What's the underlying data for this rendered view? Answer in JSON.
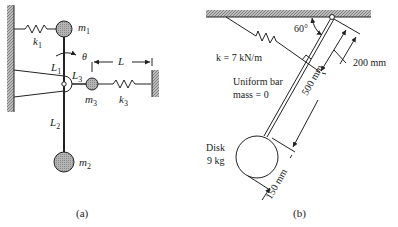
{
  "figure_a": {
    "caption": "(a)",
    "masses": [
      {
        "id": "m1",
        "label": "m",
        "sub": "1"
      },
      {
        "id": "m2",
        "label": "m",
        "sub": "2"
      },
      {
        "id": "m3",
        "label": "m",
        "sub": "3"
      }
    ],
    "springs": [
      {
        "id": "k1",
        "label": "k",
        "sub": "1"
      },
      {
        "id": "k3",
        "label": "k",
        "sub": "3"
      }
    ],
    "lengths": [
      {
        "id": "L1",
        "label": "L",
        "sub": "1"
      },
      {
        "id": "L2",
        "label": "L",
        "sub": "2"
      },
      {
        "id": "L3",
        "label": "L",
        "sub": "3"
      },
      {
        "id": "L",
        "label": "L",
        "sub": ""
      }
    ],
    "rotation": "θ"
  },
  "figure_b": {
    "caption": "(b)",
    "angle": "60°",
    "spring": "k = 7 kN/m",
    "bar_line1": "Uniform bar",
    "bar_line2": "mass = 0",
    "disk_line1": "Disk",
    "disk_line2": "9 kg",
    "dim_spring": "200 mm",
    "dim_bar": "500 mm",
    "dim_disk": "150 mm"
  },
  "colors": {
    "ink": "#222222",
    "mass_fill": "#a9a9a9",
    "hatch": "#8c8c8c"
  }
}
